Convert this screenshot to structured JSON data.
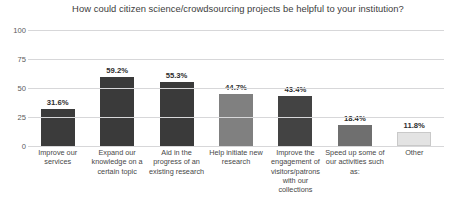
{
  "chart_data": {
    "type": "bar",
    "title": "How could citizen science/crowdsourcing projects be helpful to your institution?",
    "xlabel": "",
    "ylabel": "",
    "ylim": [
      0,
      100
    ],
    "yticks": [
      100,
      75,
      50,
      25,
      0
    ],
    "grid": true,
    "legend": false,
    "value_suffix": "%",
    "categories": [
      "Improve our services",
      "Expand our knowledge on a certain topic",
      "Aid in the progress of an existing research",
      "Help initiate new research",
      "Improve the engagement of visitors/patrons with our collections",
      "Speed up some of our activities such as:",
      "Other"
    ],
    "values": [
      31.6,
      59.2,
      55.3,
      44.7,
      43.4,
      18.4,
      11.8
    ],
    "value_labels": [
      "31.6%",
      "59.2%",
      "55.3%",
      "44.7%",
      "43.4%",
      "18.4%",
      "11.8%"
    ],
    "bar_colors": [
      "#3b3b3b",
      "#3a3a3a",
      "#3a3a3a",
      "#808080",
      "#434343",
      "#6f6f6f",
      "#e3e3e3"
    ],
    "bar_border_colors": [
      "#3b3b3b",
      "#3a3a3a",
      "#3a3a3a",
      "#808080",
      "#434343",
      "#6f6f6f",
      "#c9c9c9"
    ]
  },
  "colors": {
    "background": "#ffffff",
    "gridline": "#d7d7d9",
    "title_text": "#3c3c3c",
    "tick_text": "#5a5a5a",
    "category_text": "#474747",
    "value_text": "#2e2e2e"
  }
}
